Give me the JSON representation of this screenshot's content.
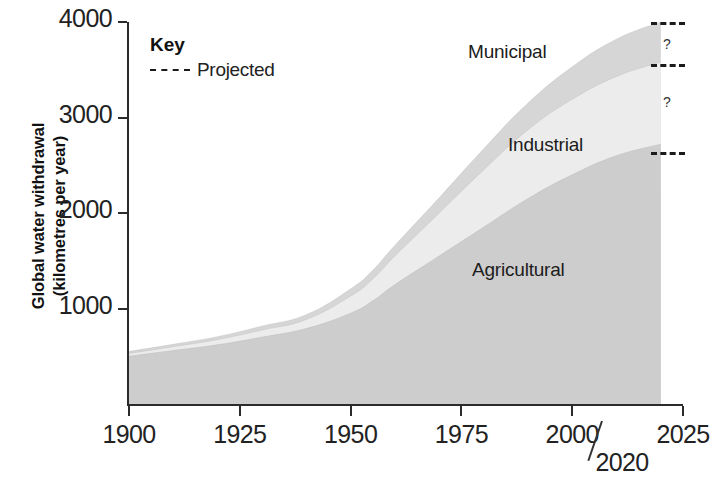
{
  "chart_data": {
    "type": "area",
    "title": "",
    "xlabel": "",
    "ylabel": "Global water withdrawal (kilometres per year)",
    "ylabel_line1": "Global water withdrawal",
    "ylabel_line2": "(kilometres per year)",
    "xlim": [
      1900,
      2025
    ],
    "ylim": [
      0,
      4000
    ],
    "xticks": [
      1900,
      1925,
      1950,
      1975,
      2000,
      2025
    ],
    "xticklabels": [
      "1900",
      "1925",
      "1950",
      "1975",
      "2000",
      "2025"
    ],
    "yticks": [
      1000,
      2000,
      3000,
      4000
    ],
    "yticklabels": [
      "1000",
      "2000",
      "3000",
      "4000"
    ],
    "grid": false,
    "stacked": true,
    "legend_position": "inside-top-left",
    "x": [
      1900,
      1910,
      1920,
      1930,
      1940,
      1950,
      1955,
      1960,
      1970,
      1980,
      1990,
      2000,
      2010,
      2020
    ],
    "series": [
      {
        "name": "Agricultural",
        "color": "#cdcdcd",
        "values": [
          500,
          560,
          620,
          700,
          790,
          950,
          1080,
          1250,
          1550,
          1850,
          2150,
          2400,
          2600,
          2720
        ]
      },
      {
        "name": "Industrial",
        "color": "#ececec",
        "values": [
          30,
          40,
          55,
          75,
          95,
          180,
          230,
          300,
          450,
          600,
          720,
          790,
          830,
          860
        ]
      },
      {
        "name": "Municipal",
        "color": "#d6d6d6",
        "values": [
          20,
          25,
          30,
          40,
          50,
          75,
          90,
          110,
          160,
          220,
          280,
          340,
          390,
          420
        ]
      }
    ],
    "totals": [
      550,
      625,
      705,
      815,
      935,
      1205,
      1400,
      1660,
      2160,
      2670,
      3150,
      3530,
      3820,
      4000
    ],
    "projection": {
      "starts_at": 2020,
      "label": "Projected",
      "marker_text": "?",
      "note": "Dashed bars and question marks indicate projected (uncertain) values beyond 2020",
      "markers": [
        {
          "id": "municipal-projection",
          "text": "?"
        },
        {
          "id": "industrial-projection",
          "text": "?"
        }
      ]
    },
    "annotations": [
      {
        "id": "year-2020-callout",
        "text": "2020"
      }
    ]
  },
  "key": {
    "title": "Key",
    "items": [
      {
        "label": "Projected",
        "style": "dashed-line"
      }
    ]
  },
  "band_labels": {
    "municipal": "Municipal",
    "industrial": "Industrial",
    "agricultural": "Agricultural"
  },
  "colors": {
    "agricultural": "#cdcdcd",
    "industrial": "#ececec",
    "municipal": "#d6d6d6",
    "axis": "#2b2b2b",
    "text": "#1a1a1a",
    "background": "#ffffff"
  }
}
